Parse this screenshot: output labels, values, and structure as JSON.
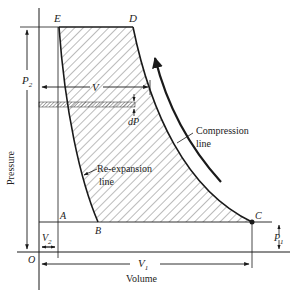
{
  "diagram": {
    "type": "pv-diagram",
    "axes": {
      "x_label": "Volume",
      "y_label": "Pressure",
      "origin_label": "O"
    },
    "points": {
      "A": "A",
      "B": "B",
      "C": "C",
      "D": "D",
      "E": "E"
    },
    "dimensions": {
      "P2": "P",
      "P2_sub": "2",
      "P1": "P",
      "P1_sub": "1",
      "V": "V",
      "V1": "V",
      "V1_sub": "1",
      "V2": "V",
      "V2_sub": "2",
      "dP": "dP"
    },
    "annotations": {
      "compression_line_1": "Compression",
      "compression_line_2": "line",
      "reexpansion_line_1": "Re-expansion",
      "reexpansion_line_2": "line"
    },
    "colors": {
      "line": "#1a1a1a",
      "hatch": "#444444",
      "background": "#ffffff"
    }
  }
}
